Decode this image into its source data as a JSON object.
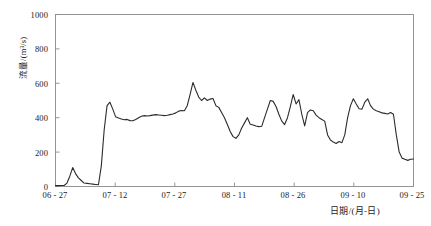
{
  "chart_data": {
    "type": "line",
    "title": "",
    "xlabel": "日期/(月-日)",
    "ylabel": "流量/(m³/s)",
    "ylim": [
      0,
      1000
    ],
    "yticks": [
      0,
      200,
      400,
      600,
      800,
      1000
    ],
    "ytick_labels": [
      "0",
      "200",
      "400",
      "600",
      "800",
      "1000"
    ],
    "xtick_labels": [
      "06 - 27",
      "07 - 12",
      "07 - 27",
      "08 - 11",
      "08 - 26",
      "09 - 10",
      "09 - 25"
    ],
    "xtick_days": [
      0,
      15,
      30,
      45,
      60,
      75,
      90
    ],
    "xlim_days": [
      0,
      90
    ],
    "grid": false,
    "legend": null,
    "series": [
      {
        "name": "流量",
        "line_color": "#2b2b2b",
        "x": [
          0,
          1,
          2,
          3,
          4,
          5,
          6,
          7,
          8,
          9,
          10,
          11,
          12,
          13,
          14,
          15,
          16,
          17,
          18,
          19,
          20,
          21,
          22,
          23,
          24,
          25,
          26,
          27,
          28,
          29,
          30,
          31,
          32,
          33,
          34,
          35,
          36,
          37,
          38,
          39,
          40,
          41,
          42,
          43,
          44,
          45,
          46,
          47,
          48,
          49,
          50,
          51,
          52,
          53,
          54,
          55,
          56,
          57,
          58,
          59,
          60,
          61,
          62,
          63,
          64,
          65,
          66,
          67,
          68,
          69,
          70,
          71,
          72,
          73,
          74,
          75,
          76,
          77,
          78,
          79,
          80,
          81,
          82,
          83,
          84,
          85,
          86,
          87,
          88,
          89,
          90
        ],
        "values": [
          5,
          5,
          6,
          6,
          20,
          60,
          110,
          75,
          50,
          35,
          20,
          18,
          16,
          14,
          12,
          10,
          120,
          330,
          470,
          490,
          450,
          405,
          398,
          392,
          388,
          390,
          383,
          382,
          390,
          400,
          408,
          412,
          410,
          412,
          415,
          418,
          416,
          414,
          412,
          414,
          418,
          422,
          428,
          438,
          442,
          440,
          470,
          535,
          605,
          560,
          520,
          500,
          515,
          500,
          508,
          512,
          470,
          460,
          430,
          400,
          360,
          320,
          290,
          280,
          300,
          340,
          370,
          400,
          362,
          358,
          352,
          348,
          350,
          400,
          450,
          500,
          495,
          465,
          420,
          380,
          360,
          400,
          465,
          535,
          480,
          505,
          420,
          352,
          430,
          445,
          440
        ],
        "values_tail": [
          415,
          400,
          390,
          380,
          300,
          270,
          258,
          250,
          262,
          255,
          300,
          400,
          470,
          510,
          480,
          452,
          450,
          490,
          510,
          470,
          450,
          440,
          435,
          428,
          425,
          422,
          430,
          420,
          300,
          200,
          165,
          158,
          152,
          158,
          160
        ]
      }
    ]
  },
  "axes": {
    "y_axis_name": "流量/(m³/s)",
    "x_axis_name": "日期/(月-日)"
  }
}
